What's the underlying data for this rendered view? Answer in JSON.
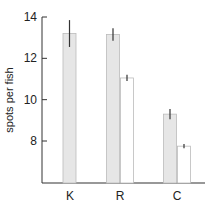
{
  "chart_data": {
    "type": "bar",
    "title": "",
    "xlabel": "",
    "ylabel": "spots per fish",
    "ylim": [
      6,
      14
    ],
    "yticks": [
      8,
      10,
      12,
      14
    ],
    "grid": false,
    "legend": null,
    "categories": [
      "K",
      "R",
      "C"
    ],
    "series": [
      {
        "name": "gray",
        "color": "#e6e6e6",
        "values": [
          13.2,
          13.15,
          9.3
        ],
        "error": [
          0.65,
          0.3,
          0.25
        ]
      },
      {
        "name": "white",
        "color": "#ffffff",
        "values": [
          null,
          11.05,
          7.75
        ],
        "error": [
          null,
          0.15,
          0.1
        ]
      }
    ]
  },
  "labels": {
    "ylabel": "spots per fish",
    "yticks": [
      "8",
      "10",
      "12",
      "14"
    ],
    "categories": [
      "K",
      "R",
      "C"
    ]
  }
}
